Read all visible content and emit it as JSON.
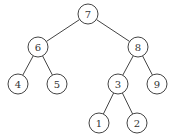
{
  "diagram": {
    "type": "binary-tree",
    "radius": 10,
    "colors": {
      "stroke": "#444444",
      "text": "#333333",
      "background": "#ffffff"
    },
    "nodes": [
      {
        "id": "n7",
        "label": "7",
        "x": 88,
        "y": 14
      },
      {
        "id": "n6",
        "label": "6",
        "x": 38,
        "y": 47
      },
      {
        "id": "n8",
        "label": "8",
        "x": 138,
        "y": 47
      },
      {
        "id": "n4",
        "label": "4",
        "x": 18,
        "y": 84
      },
      {
        "id": "n5",
        "label": "5",
        "x": 57,
        "y": 84
      },
      {
        "id": "n3",
        "label": "3",
        "x": 118,
        "y": 84
      },
      {
        "id": "n9",
        "label": "9",
        "x": 157,
        "y": 84
      },
      {
        "id": "n1",
        "label": "1",
        "x": 99,
        "y": 123
      },
      {
        "id": "n2",
        "label": "2",
        "x": 137,
        "y": 123
      }
    ],
    "edges": [
      [
        "n7",
        "n6"
      ],
      [
        "n7",
        "n8"
      ],
      [
        "n6",
        "n4"
      ],
      [
        "n6",
        "n5"
      ],
      [
        "n8",
        "n3"
      ],
      [
        "n8",
        "n9"
      ],
      [
        "n3",
        "n1"
      ],
      [
        "n3",
        "n2"
      ]
    ]
  }
}
